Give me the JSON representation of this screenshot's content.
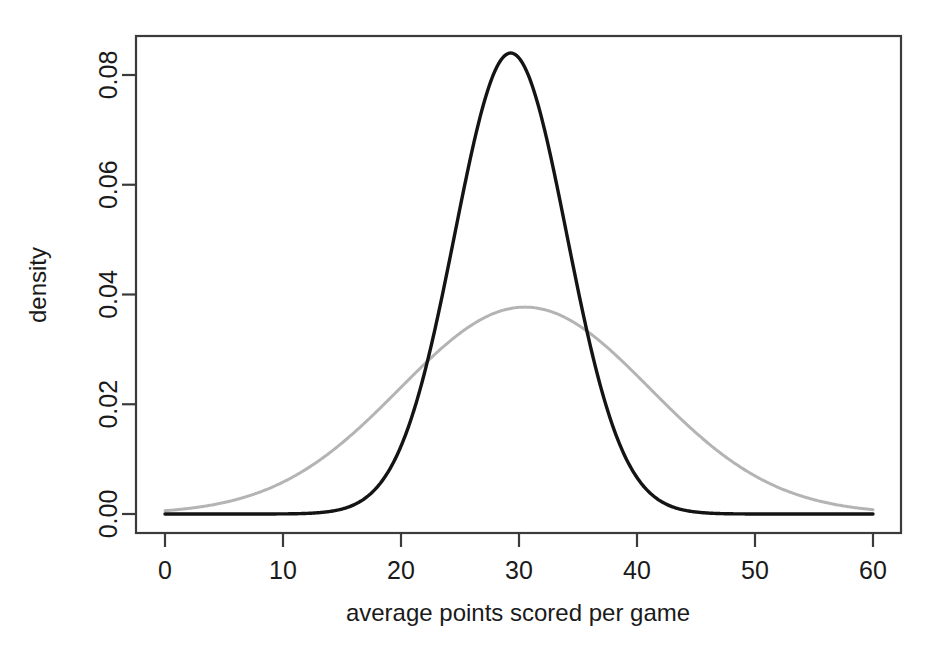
{
  "figure": {
    "background_color": "#ffffff",
    "plot_box": {
      "left": 136,
      "top": 36,
      "right": 901,
      "bottom": 533
    }
  },
  "axes": {
    "x": {
      "label": "average points scored per game",
      "ticks": [
        0,
        10,
        20,
        30,
        40,
        50,
        60
      ],
      "tick_labels": [
        "0",
        "10",
        "20",
        "30",
        "40",
        "50",
        "60"
      ],
      "range": [
        0,
        60
      ],
      "pixel_range": [
        165,
        873
      ]
    },
    "y": {
      "label": "density",
      "ticks": [
        0.0,
        0.02,
        0.04,
        0.06,
        0.08
      ],
      "tick_labels": [
        "0.00",
        "0.02",
        "0.04",
        "0.06",
        "0.08"
      ],
      "range": [
        0.0,
        0.0875
      ],
      "pixel_range": [
        514,
        75
      ],
      "label_rotation_deg": -90
    }
  },
  "chart_data": {
    "type": "line",
    "title": "",
    "xlabel": "average points scored per game",
    "ylabel": "density",
    "xlim": [
      0,
      60
    ],
    "ylim": [
      0.0,
      0.0875
    ],
    "grid": false,
    "legend": "none",
    "annotations": [
      {
        "text": "curves cross",
        "x": 22.0,
        "y": 0.0272
      },
      {
        "text": "curves cross",
        "x": 35.5,
        "y": 0.0338
      }
    ],
    "series": [
      {
        "name": "narrow density (black)",
        "color": "#141414",
        "linewidth": 3.4,
        "distribution": "normal",
        "mean": 29.3,
        "sd": 4.75,
        "peak_value": 0.084,
        "peak_x": 29.3,
        "x": [
          0,
          2,
          4,
          6,
          8,
          10,
          12,
          14,
          15,
          16,
          17,
          18,
          19,
          20,
          21,
          22,
          23,
          24,
          25,
          26,
          27,
          28,
          29,
          29.3,
          30,
          31,
          32,
          33,
          34,
          35,
          36,
          37,
          38,
          39,
          40,
          41,
          42,
          43,
          44,
          46,
          48,
          50,
          52,
          54,
          56,
          58,
          60
        ],
        "values": [
          0.0,
          0.0,
          0.0,
          0.0,
          0.0,
          0.0,
          0.0001,
          0.0003,
          0.0005,
          0.0009,
          0.0015,
          0.0025,
          0.004,
          0.0061,
          0.0091,
          0.013,
          0.0181,
          0.0241,
          0.031,
          0.0383,
          0.0456,
          0.0524,
          0.0581,
          0.0592,
          0.062,
          0.0638,
          0.0634,
          0.0609,
          0.0564,
          0.0504,
          0.0435,
          0.0363,
          0.0292,
          0.0227,
          0.017,
          0.0123,
          0.0086,
          0.0058,
          0.0038,
          0.0015,
          0.0005,
          0.0001,
          0.0,
          0.0,
          0.0,
          0.0,
          0.0
        ]
      },
      {
        "name": "wide density (gray)",
        "color": "#b4b4b4",
        "linewidth": 3.0,
        "distribution": "normal",
        "mean": 30.5,
        "sd": 10.6,
        "peak_value": 0.0377,
        "peak_x": 30.5,
        "x": [
          0,
          2,
          4,
          6,
          8,
          10,
          12,
          14,
          16,
          18,
          20,
          22,
          24,
          26,
          28,
          30,
          30.5,
          32,
          34,
          36,
          38,
          40,
          42,
          44,
          46,
          48,
          50,
          52,
          54,
          56,
          58,
          60
        ],
        "values": [
          0.0004,
          0.0008,
          0.0016,
          0.0029,
          0.0049,
          0.0077,
          0.0113,
          0.0156,
          0.0203,
          0.025,
          0.0294,
          0.033,
          0.0356,
          0.0372,
          0.0377,
          0.0376,
          0.0377,
          0.0368,
          0.035,
          0.0325,
          0.0294,
          0.0259,
          0.0223,
          0.0187,
          0.0153,
          0.0122,
          0.0094,
          0.0071,
          0.0052,
          0.0037,
          0.0026,
          0.0017
        ]
      }
    ]
  }
}
